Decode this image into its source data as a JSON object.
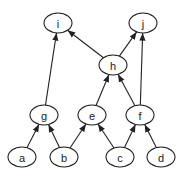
{
  "diagram": {
    "type": "directed-graph",
    "nodes": [
      {
        "id": "i",
        "label": "i",
        "x": 58,
        "y": 23
      },
      {
        "id": "j",
        "label": "j",
        "x": 143,
        "y": 23
      },
      {
        "id": "h",
        "label": "h",
        "x": 113,
        "y": 65
      },
      {
        "id": "g",
        "label": "g",
        "x": 44,
        "y": 115
      },
      {
        "id": "e",
        "label": "e",
        "x": 92,
        "y": 115
      },
      {
        "id": "f",
        "label": "f",
        "x": 140,
        "y": 115
      },
      {
        "id": "a",
        "label": "a",
        "x": 22,
        "y": 157
      },
      {
        "id": "b",
        "label": "b",
        "x": 64,
        "y": 157
      },
      {
        "id": "c",
        "label": "c",
        "x": 120,
        "y": 157
      },
      {
        "id": "d",
        "label": "d",
        "x": 161,
        "y": 157
      }
    ],
    "edges": [
      {
        "from": "a",
        "to": "g"
      },
      {
        "from": "b",
        "to": "g"
      },
      {
        "from": "b",
        "to": "e"
      },
      {
        "from": "c",
        "to": "e"
      },
      {
        "from": "c",
        "to": "f"
      },
      {
        "from": "d",
        "to": "f"
      },
      {
        "from": "e",
        "to": "h"
      },
      {
        "from": "f",
        "to": "h"
      },
      {
        "from": "h",
        "to": "i"
      },
      {
        "from": "h",
        "to": "j"
      },
      {
        "from": "g",
        "to": "i"
      },
      {
        "from": "f",
        "to": "j"
      }
    ]
  }
}
